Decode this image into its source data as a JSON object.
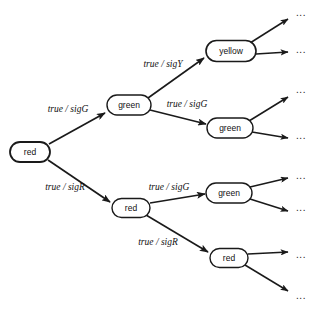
{
  "diagram": {
    "type": "computation-tree",
    "colors": {
      "stroke": "#1a1a1a",
      "node_fill": "#ffffff",
      "text": "#111111",
      "background": "#ffffff"
    },
    "nodes": [
      {
        "id": "n0",
        "label": "red",
        "cx": 30,
        "cy": 152,
        "rx": 20,
        "ry": 10,
        "stroke_width": 1.8
      },
      {
        "id": "n1",
        "label": "green",
        "cx": 129,
        "cy": 105,
        "rx": 22,
        "ry": 10,
        "stroke_width": 1.4
      },
      {
        "id": "n2",
        "label": "red",
        "cx": 131,
        "cy": 208,
        "rx": 19,
        "ry": 9.5,
        "stroke_width": 1.4
      },
      {
        "id": "n3",
        "label": "yellow",
        "cx": 231,
        "cy": 51,
        "rx": 25,
        "ry": 10.5,
        "stroke_width": 1.6
      },
      {
        "id": "n4",
        "label": "green",
        "cx": 230,
        "cy": 128,
        "rx": 23,
        "ry": 10,
        "stroke_width": 1.4
      },
      {
        "id": "n5",
        "label": "green",
        "cx": 229,
        "cy": 193,
        "rx": 23,
        "ry": 10,
        "stroke_width": 1.4
      },
      {
        "id": "n6",
        "label": "red",
        "cx": 229,
        "cy": 258,
        "rx": 19,
        "ry": 9.5,
        "stroke_width": 1.4
      }
    ],
    "edges": [
      {
        "from": "n0",
        "to": "n1",
        "label": "true / sigG",
        "label_x": 68,
        "label_y": 110,
        "x1": 49,
        "y1": 144,
        "x2": 105,
        "y2": 113,
        "stroke_width": 1.7
      },
      {
        "from": "n0",
        "to": "n2",
        "label": "true / sigR",
        "label_x": 65,
        "label_y": 188,
        "x1": 48,
        "y1": 160,
        "x2": 110,
        "y2": 202,
        "stroke_width": 1.7
      },
      {
        "from": "n1",
        "to": "n3",
        "label": "true / sigY",
        "label_x": 163,
        "label_y": 65,
        "x1": 148,
        "y1": 98,
        "x2": 204,
        "y2": 58,
        "stroke_width": 1.6
      },
      {
        "from": "n1",
        "to": "n4",
        "label": "true / sigG",
        "label_x": 187,
        "label_y": 105,
        "x1": 150,
        "y1": 110,
        "x2": 206,
        "y2": 124,
        "stroke_width": 1.6
      },
      {
        "from": "n2",
        "to": "n5",
        "label": "true / sigG",
        "label_x": 169,
        "label_y": 188,
        "x1": 150,
        "y1": 203,
        "x2": 205,
        "y2": 194,
        "stroke_width": 1.6
      },
      {
        "from": "n2",
        "to": "n6",
        "label": "true / sigR",
        "label_x": 158,
        "label_y": 243,
        "x1": 146,
        "y1": 215,
        "x2": 208,
        "y2": 252,
        "stroke_width": 1.6
      }
    ],
    "open_branches": [
      {
        "from": "n3",
        "x1": 250,
        "y1": 43,
        "x2": 288,
        "y2": 19,
        "ellipsis_x": 301,
        "ellipsis_y": 13
      },
      {
        "from": "n3",
        "x1": 256,
        "y1": 54,
        "x2": 288,
        "y2": 52,
        "ellipsis_x": 301,
        "ellipsis_y": 50
      },
      {
        "from": "n4",
        "x1": 249,
        "y1": 121,
        "x2": 288,
        "y2": 97,
        "ellipsis_x": 301,
        "ellipsis_y": 90
      },
      {
        "from": "n4",
        "x1": 252,
        "y1": 132,
        "x2": 288,
        "y2": 138,
        "ellipsis_x": 301,
        "ellipsis_y": 136
      },
      {
        "from": "n5",
        "x1": 250,
        "y1": 187,
        "x2": 288,
        "y2": 178,
        "ellipsis_x": 301,
        "ellipsis_y": 176
      },
      {
        "from": "n5",
        "x1": 250,
        "y1": 199,
        "x2": 288,
        "y2": 211,
        "ellipsis_x": 301,
        "ellipsis_y": 208
      },
      {
        "from": "n6",
        "x1": 248,
        "y1": 254,
        "x2": 288,
        "y2": 252,
        "ellipsis_x": 301,
        "ellipsis_y": 255
      },
      {
        "from": "n6",
        "x1": 245,
        "y1": 265,
        "x2": 288,
        "y2": 291,
        "ellipsis_x": 301,
        "ellipsis_y": 296
      }
    ],
    "ellipsis_glyph": "..."
  }
}
